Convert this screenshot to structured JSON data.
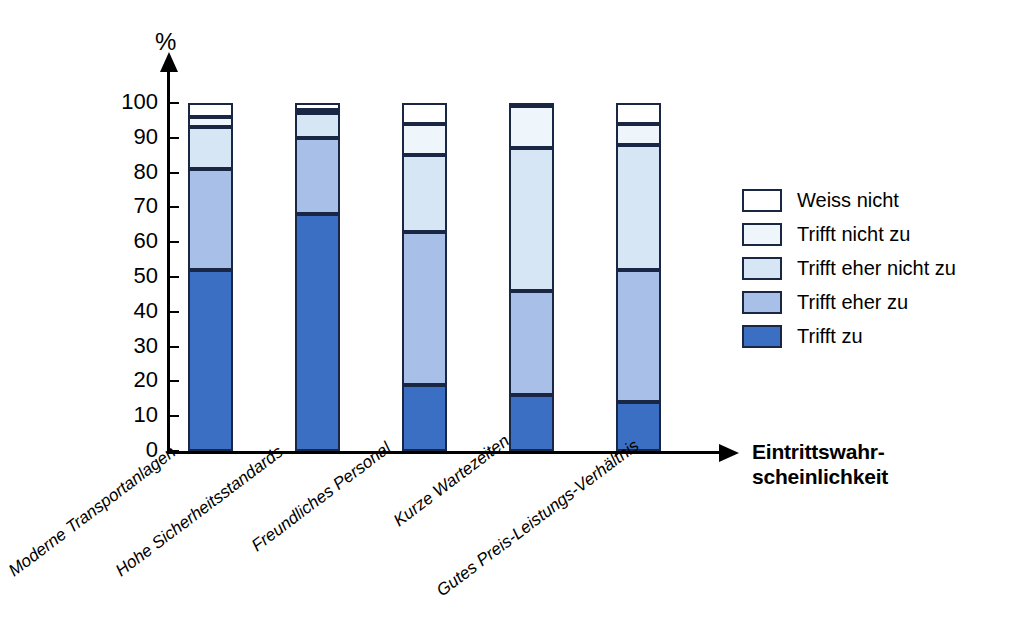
{
  "axis": {
    "y_unit_label": "%",
    "x_title_line1": "Eintrittswahr-",
    "x_title_line2": "scheinlichkeit",
    "y_ticks": [
      "100",
      "90",
      "80",
      "70",
      "60",
      "50",
      "40",
      "30",
      "20",
      "10",
      "0"
    ]
  },
  "legend": {
    "items": [
      {
        "label": "Weiss nicht",
        "color": "#ffffff"
      },
      {
        "label": "Trifft nicht zu",
        "color": "#eef5fb"
      },
      {
        "label": "Trifft eher nicht zu",
        "color": "#d6e6f4"
      },
      {
        "label": "Trifft eher zu",
        "color": "#a8bfe8"
      },
      {
        "label": "Trifft zu",
        "color": "#3a6fc4"
      }
    ]
  },
  "chart_data": {
    "type": "bar",
    "title": "",
    "subtitle": "",
    "stacked": true,
    "xlabel": "Eintrittswahrscheinlichkeit",
    "ylabel": "%",
    "ylim": [
      0,
      100
    ],
    "ytick_step": 10,
    "grid": false,
    "legend_position": "right",
    "categories": [
      "Moderne Transportanlagen",
      "Hohe Sicherheitsstandards",
      "Freundliches Personal",
      "Kurze Wartezeiten",
      "Gutes Preis-Leistungs-Verhältnis"
    ],
    "series": [
      {
        "name": "Trifft zu",
        "color": "#3a6fc4",
        "values": [
          52,
          68,
          19,
          16,
          14
        ]
      },
      {
        "name": "Trifft eher zu",
        "color": "#a8bfe8",
        "values": [
          29,
          22,
          44,
          30,
          38
        ]
      },
      {
        "name": "Trifft eher nicht zu",
        "color": "#d6e6f4",
        "values": [
          12,
          7,
          22,
          41,
          36
        ]
      },
      {
        "name": "Trifft nicht zu",
        "color": "#eef5fb",
        "values": [
          3,
          1,
          9,
          12,
          6
        ]
      },
      {
        "name": "Weiss nicht",
        "color": "#ffffff",
        "values": [
          4,
          2,
          6,
          1,
          6
        ]
      }
    ],
    "cumulative_tops": [
      [
        52,
        81,
        93,
        96,
        100
      ],
      [
        68,
        90,
        97,
        98,
        100
      ],
      [
        19,
        63,
        85,
        94,
        100
      ],
      [
        16,
        46,
        87,
        99,
        100
      ],
      [
        14,
        52,
        88,
        94,
        100
      ]
    ]
  }
}
